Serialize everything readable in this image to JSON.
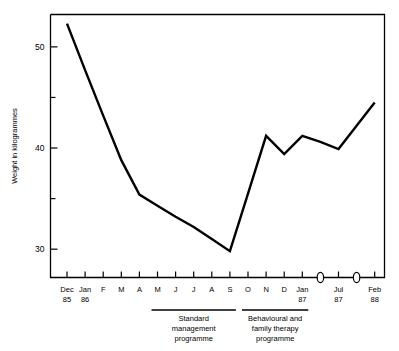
{
  "chart_data": {
    "type": "line",
    "title": "",
    "xlabel": "",
    "ylabel": "Weight in kilogrammes",
    "ylim": [
      27.2,
      53.2
    ],
    "yticks_major": [
      30,
      40,
      50
    ],
    "yticks_minor": [
      35,
      45
    ],
    "ytick_labels": [
      "30",
      "40",
      "50"
    ],
    "grid": false,
    "legend": "none",
    "axis_has_breaks": true,
    "categories": [
      "Dec 85",
      "Jan 86",
      "F",
      "M",
      "A",
      "M",
      "J",
      "J",
      "A",
      "S",
      "O",
      "N",
      "D",
      "Jan 87",
      "",
      "Jul 87",
      "",
      "Feb 88"
    ],
    "tick_labels_primary": [
      "Dec",
      "Jan",
      "F",
      "M",
      "A",
      "M",
      "J",
      "J",
      "A",
      "S",
      "O",
      "N",
      "D",
      "Jan",
      "",
      "Jul",
      "",
      "Feb"
    ],
    "tick_labels_secondary": [
      "85",
      "86",
      "",
      "",
      "",
      "",
      "",
      "",
      "",
      "",
      "",
      "",
      "",
      "87",
      "",
      "87",
      "",
      "88"
    ],
    "axis_break_positions": [
      14,
      16
    ],
    "series": [
      {
        "name": "Weight",
        "values": [
          52.3,
          47.7,
          43.2,
          38.8,
          35.4,
          34.3,
          33.2,
          32.2,
          31.0,
          29.8,
          35.5,
          41.2,
          39.4,
          41.2,
          40.6,
          39.9,
          42.2,
          44.5
        ]
      }
    ],
    "annotations": [
      {
        "id": "standard-management",
        "lines": [
          "Standard",
          "management",
          "programme"
        ],
        "span_start": 5,
        "span_end": 9
      },
      {
        "id": "behavioural-family-therapy",
        "lines": [
          "Behavioural and",
          "family therapy",
          "programme"
        ],
        "span_start": 10,
        "span_end": 13
      }
    ]
  },
  "axis": {
    "y_title": "Weight in kilogrammes"
  },
  "colors": {
    "line": "#000000",
    "frame": "#000000",
    "background": "#ffffff"
  }
}
